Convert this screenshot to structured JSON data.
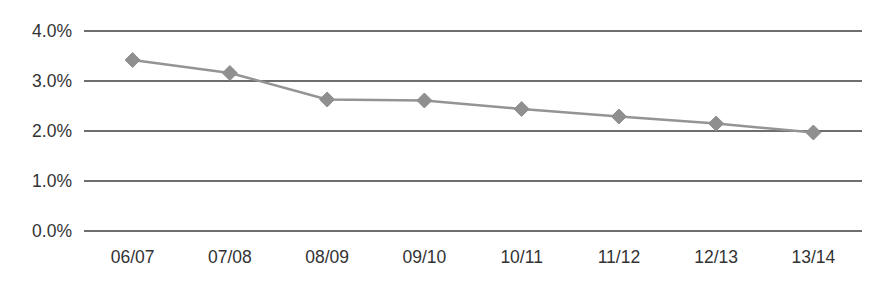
{
  "chart_data": {
    "type": "line",
    "title": "",
    "subtitle": "",
    "xlabel": "",
    "ylabel": "",
    "categories": [
      "06/07",
      "07/08",
      "08/09",
      "09/10",
      "10/11",
      "11/12",
      "12/13",
      "13/14"
    ],
    "series": [
      {
        "name": "",
        "values": [
          3.42,
          3.16,
          2.63,
          2.61,
          2.44,
          2.29,
          2.15,
          1.97
        ]
      }
    ],
    "ylim": [
      0.0,
      4.0
    ],
    "ytick_values": [
      4.0,
      3.0,
      2.0,
      1.0,
      0.0
    ],
    "ytick_labels": [
      "4.0%",
      "3.0%",
      "2.0%",
      "1.0%",
      "0.0%"
    ],
    "grid": true,
    "grid_axis": "y",
    "legend": false,
    "legend_position": "none",
    "marker": "diamond",
    "colors": {
      "line": "#949494",
      "marker": "#8f8f8f",
      "gridline": "#6e6e6e",
      "text": "#333333",
      "background": "#ffffff"
    }
  },
  "layout": {
    "plot_left": 84,
    "plot_right": 862,
    "plot_top": 31,
    "plot_bottom": 231,
    "x_label_y": 258
  }
}
